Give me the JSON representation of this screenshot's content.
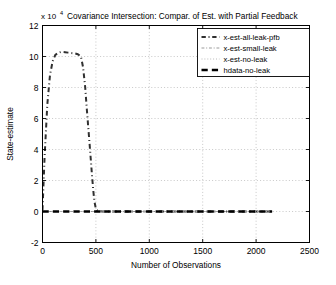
{
  "chart_data": {
    "type": "line",
    "title": "Covariance Intersection: Compar. of Est. with Partial Feedback",
    "xlabel": "Number of Observations",
    "ylabel": "State-estimate",
    "y_exponent_label": "x 10",
    "y_exponent_power": "4",
    "xlim": [
      0,
      2500
    ],
    "ylim": [
      -2,
      12
    ],
    "xticks": [
      0,
      500,
      1000,
      1500,
      2000,
      2500
    ],
    "xticklabels": [
      "0",
      "500",
      "1000",
      "1500",
      "2000",
      "2500"
    ],
    "yticks": [
      -2,
      0,
      2,
      4,
      6,
      8,
      10,
      12
    ],
    "yticklabels": [
      "-2",
      "0",
      "2",
      "4",
      "6",
      "8",
      "10",
      "12"
    ],
    "grid": true,
    "grid_style": "dotted",
    "legend_position": "upper right",
    "series": [
      {
        "name": "x-est-all-leak-pfb",
        "style": "dash-dot",
        "color": "#303030",
        "width": 2.0,
        "x": [
          0,
          20,
          45,
          70,
          95,
          120,
          150,
          180,
          210,
          240,
          270,
          300,
          330,
          360,
          380,
          400,
          415,
          430,
          445,
          455,
          465,
          475,
          485,
          500,
          520,
          560,
          620,
          700,
          800,
          950,
          1100,
          1300,
          1500,
          1700,
          1900,
          2050,
          2150
        ],
        "y": [
          0.1,
          3.6,
          6.9,
          8.8,
          9.7,
          10.1,
          10.25,
          10.3,
          10.28,
          10.25,
          10.22,
          10.2,
          10.15,
          10.0,
          9.3,
          8.0,
          6.6,
          5.3,
          4.0,
          3.1,
          2.2,
          1.4,
          0.7,
          0.15,
          0.02,
          0.0,
          0.0,
          0.0,
          0.0,
          0.0,
          0.0,
          0.0,
          0.0,
          0.0,
          0.0,
          0.0,
          0.0
        ]
      },
      {
        "name": "x-est-small-leak",
        "style": "dash-dot",
        "color": "#888888",
        "width": 1.1,
        "x": [
          0,
          150,
          400,
          500,
          700,
          1000,
          1400,
          1800,
          2150
        ],
        "y": [
          0.0,
          0.0,
          0.0,
          0.0,
          0.0,
          0.0,
          0.0,
          0.0,
          0.0
        ]
      },
      {
        "name": "x-est-no-leak",
        "style": "dotted",
        "color": "#aaaaaa",
        "width": 1.0,
        "x": [
          0,
          200,
          500,
          900,
          1300,
          1700,
          2150
        ],
        "y": [
          0.0,
          0.0,
          0.0,
          0.0,
          0.0,
          0.0,
          0.0
        ]
      },
      {
        "name": "hdata-no-leak",
        "style": "dashed",
        "color": "#000000",
        "width": 2.4,
        "x": [
          0,
          100,
          250,
          400,
          480,
          520,
          600,
          760,
          900,
          1100,
          1350,
          1600,
          1850,
          2150
        ],
        "y": [
          0.0,
          0.0,
          0.0,
          0.0,
          0.0,
          0.0,
          0.0,
          0.0,
          0.0,
          0.0,
          0.0,
          0.0,
          0.0,
          0.0
        ]
      }
    ],
    "legend_entries": [
      {
        "label": "x-est-all-leak-pfb",
        "style": "dash-dot",
        "color": "#303030",
        "width": 1.8
      },
      {
        "label": "x-est-small-leak",
        "style": "dash-dot",
        "color": "#999999",
        "width": 1.2
      },
      {
        "label": "x-est-no-leak",
        "style": "dotted",
        "color": "#bbbbbb",
        "width": 1.0
      },
      {
        "label": "hdata-no-leak",
        "style": "dashed",
        "color": "#000000",
        "width": 2.4
      }
    ]
  }
}
